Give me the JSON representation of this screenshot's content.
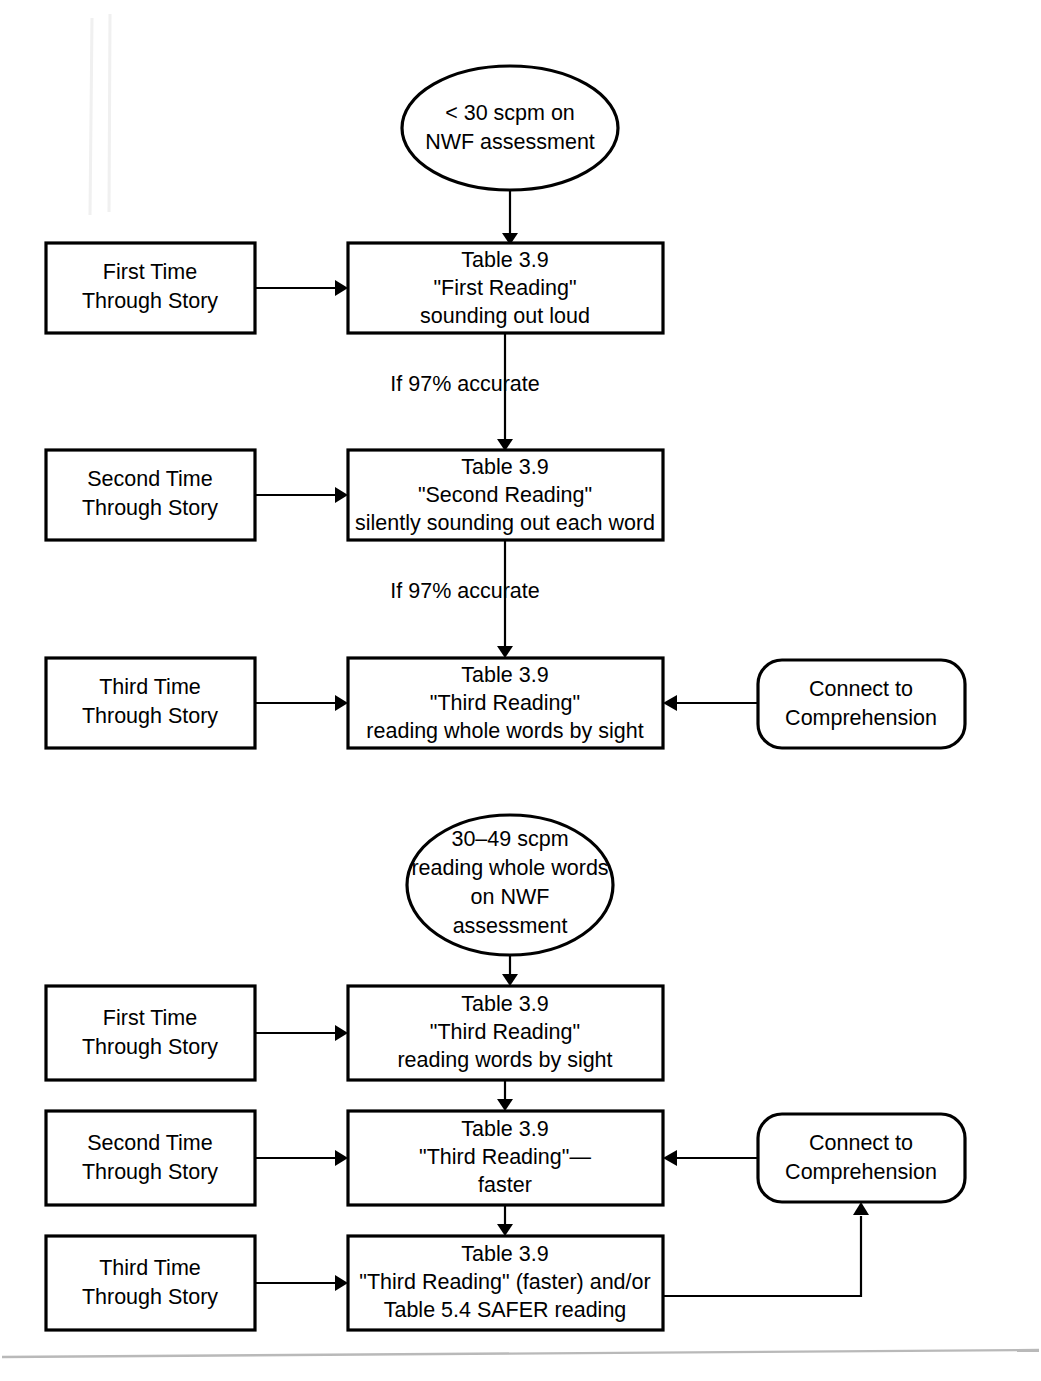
{
  "page": {
    "background_color": "#ffffff",
    "ink_color": "#000000",
    "width": 1041,
    "height": 1381
  },
  "diagram": {
    "type": "flowchart",
    "sections": [
      {
        "id": "section-low-score",
        "entry_label": "< 30 scpm on NWF assessment",
        "entry_lines": [
          "< 30 scpm on",
          "NWF assessment"
        ],
        "rows": [
          {
            "left_label": "First Time Through Story",
            "left_lines": [
              "First Time",
              "Through Story"
            ],
            "main_lines": [
              "Table 3.9",
              "\"First Reading\"",
              "sounding out loud"
            ],
            "side_label": null,
            "side_lines": [],
            "edge_below": "If 97% accurate"
          },
          {
            "left_label": "Second Time Through Story",
            "left_lines": [
              "Second Time",
              "Through Story"
            ],
            "main_lines": [
              "Table 3.9",
              "\"Second Reading\"",
              "silently sounding out each word"
            ],
            "side_label": null,
            "side_lines": [],
            "edge_below": "If 97% accurate"
          },
          {
            "left_label": "Third Time Through Story",
            "left_lines": [
              "Third Time",
              "Through Story"
            ],
            "main_lines": [
              "Table 3.9",
              "\"Third Reading\"",
              "reading whole words by sight"
            ],
            "side_label": "Connect to Comprehension",
            "side_lines": [
              "Connect to",
              "Comprehension"
            ],
            "edge_below": null
          }
        ]
      },
      {
        "id": "section-mid-score",
        "entry_label": "30–49 scpm reading whole words on NWF assessment",
        "entry_lines": [
          "30–49 scpm",
          "reading whole words",
          "on NWF",
          "assessment"
        ],
        "rows": [
          {
            "left_label": "First Time Through Story",
            "left_lines": [
              "First Time",
              "Through Story"
            ],
            "main_lines": [
              "Table 3.9",
              "\"Third Reading\"",
              "reading words by sight"
            ],
            "side_label": null,
            "side_lines": [],
            "edge_below": null
          },
          {
            "left_label": "Second Time Through Story",
            "left_lines": [
              "Second Time",
              "Through Story"
            ],
            "main_lines": [
              "Table 3.9",
              "\"Third Reading\"—",
              "faster"
            ],
            "side_label": "Connect to Comprehension",
            "side_lines": [
              "Connect to",
              "Comprehension"
            ],
            "edge_below": null
          },
          {
            "left_label": "Third Time Through Story",
            "left_lines": [
              "Third Time",
              "Through Story"
            ],
            "main_lines": [
              "Table 3.9",
              "\"Third Reading\" (faster) and/or",
              "Table 5.4 SAFER reading"
            ],
            "side_label": null,
            "side_lines": [],
            "edge_below": null
          }
        ]
      }
    ]
  },
  "text": {
    "s1_entry_l1": "< 30 scpm on",
    "s1_entry_l2": "NWF assessment",
    "s1_r1_left_l1": "First Time",
    "s1_r1_left_l2": "Through Story",
    "s1_r1_main_l1": "Table 3.9",
    "s1_r1_main_l2": "\"First Reading\"",
    "s1_r1_main_l3": "sounding out loud",
    "s1_edge1": "If 97% accurate",
    "s1_r2_left_l1": "Second Time",
    "s1_r2_left_l2": "Through Story",
    "s1_r2_main_l1": "Table 3.9",
    "s1_r2_main_l2": "\"Second Reading\"",
    "s1_r2_main_l3": "silently sounding out each word",
    "s1_edge2": "If 97% accurate",
    "s1_r3_left_l1": "Third Time",
    "s1_r3_left_l2": "Through Story",
    "s1_r3_main_l1": "Table 3.9",
    "s1_r3_main_l2": "\"Third Reading\"",
    "s1_r3_main_l3": "reading whole words by sight",
    "s1_r3_side_l1": "Connect to",
    "s1_r3_side_l2": "Comprehension",
    "s2_entry_l1": "30–49 scpm",
    "s2_entry_l2": "reading whole words",
    "s2_entry_l3": "on NWF",
    "s2_entry_l4": "assessment",
    "s2_r1_left_l1": "First Time",
    "s2_r1_left_l2": "Through Story",
    "s2_r1_main_l1": "Table 3.9",
    "s2_r1_main_l2": "\"Third Reading\"",
    "s2_r1_main_l3": "reading words by sight",
    "s2_r2_left_l1": "Second Time",
    "s2_r2_left_l2": "Through Story",
    "s2_r2_main_l1": "Table 3.9",
    "s2_r2_main_l2": "\"Third Reading\"—",
    "s2_r2_main_l3": "faster",
    "s2_r2_side_l1": "Connect to",
    "s2_r2_side_l2": "Comprehension",
    "s2_r3_left_l1": "Third Time",
    "s2_r3_left_l2": "Through Story",
    "s2_r3_main_l1": "Table 3.9",
    "s2_r3_main_l2": "\"Third Reading\" (faster) and/or",
    "s2_r3_main_l3": "Table 5.4 SAFER reading"
  }
}
